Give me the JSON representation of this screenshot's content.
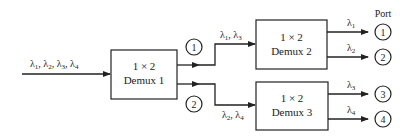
{
  "diagram": {
    "input_label": {
      "parts": [
        {
          "s": "λ",
          "n": "1"
        },
        {
          "s": "λ",
          "n": "2"
        },
        {
          "s": "λ",
          "n": "3"
        },
        {
          "s": "λ",
          "n": "4"
        }
      ]
    },
    "demux1": {
      "line1": "1 × 2",
      "line2": "Demux 1"
    },
    "demux2": {
      "line1": "1 × 2",
      "line2": "Demux 2"
    },
    "demux3": {
      "line1": "1 × 2",
      "line2": "Demux 3"
    },
    "branch_nodes": {
      "upper": "1",
      "lower": "2"
    },
    "branch_labels": {
      "upper": [
        {
          "s": "λ",
          "n": "1"
        },
        {
          "s": "λ",
          "n": "3"
        }
      ],
      "lower": [
        {
          "s": "λ",
          "n": "2"
        },
        {
          "s": "λ",
          "n": "4"
        }
      ]
    },
    "output_labels": {
      "o1": {
        "s": "λ",
        "n": "1"
      },
      "o2": {
        "s": "λ",
        "n": "2"
      },
      "o3": {
        "s": "λ",
        "n": "3"
      },
      "o4": {
        "s": "λ",
        "n": "4"
      }
    },
    "port_header": "Port",
    "ports": [
      "1",
      "2",
      "3",
      "4"
    ],
    "stroke_color": "#222222"
  }
}
